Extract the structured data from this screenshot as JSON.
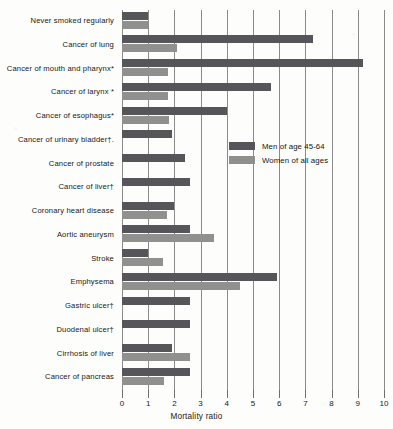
{
  "chart_data": {
    "type": "bar",
    "orientation": "horizontal",
    "title": "",
    "xlabel": "Mortality ratio",
    "ylabel": "",
    "xlim": [
      0,
      10
    ],
    "xticks": [
      0,
      1,
      2,
      3,
      4,
      5,
      6,
      7,
      8,
      9,
      10
    ],
    "grid": "vertical",
    "legend_position": "inside-right",
    "categories": [
      "Never smoked regularly",
      "Cancer of lung",
      "Cancer of mouth and pharynx*",
      "Cancer of larynx *",
      "Cancer of esophagus*",
      "Cancer of urinary bladder†.",
      "Cancer of prostate",
      "Cancer of liver†",
      "Coronary heart disease",
      "Aortic aneurysm",
      "Stroke",
      "Emphysema",
      "Gastric ulcer†",
      "Duodenal ulcer†",
      "Cirrhosis of liver",
      "Cancer of pancreas"
    ],
    "series": [
      {
        "name": "Men of age 45-64",
        "color": "#55555a",
        "values": [
          1.0,
          7.3,
          9.2,
          5.7,
          4.0,
          1.9,
          2.4,
          2.6,
          2.0,
          2.6,
          1.0,
          5.9,
          2.6,
          2.6,
          1.9,
          2.6
        ]
      },
      {
        "name": "Women of all ages",
        "color": "#90908f",
        "values": [
          1.0,
          2.1,
          1.75,
          1.75,
          1.8,
          null,
          null,
          null,
          1.7,
          3.5,
          1.55,
          4.5,
          null,
          null,
          2.6,
          1.6
        ]
      }
    ]
  },
  "legend": {
    "items": [
      {
        "label": "Men of age 45-64",
        "swatch": "men"
      },
      {
        "label": "Women of all ages",
        "swatch": "women"
      }
    ]
  },
  "axis": {
    "title": "Mortality ratio"
  }
}
